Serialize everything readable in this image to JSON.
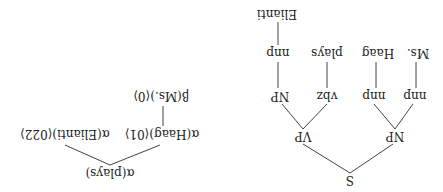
{
  "parse_tree": {
    "root": "S",
    "np_subject": "NP",
    "vp": "VP",
    "nnp1": "nnp",
    "nnp2": "nnp",
    "vbz": "vbz",
    "np_object": "NP",
    "word_ms": "Ms.",
    "word_haag": "Haag",
    "word_plays": "plays",
    "nnp3": "nnp",
    "word_elianti": "Elianti"
  },
  "derivation_tree": {
    "root": "α(plays)",
    "haag": "α(Haag)⟨01⟩",
    "elianti": "α(Elianti)⟨022⟩",
    "ms": "β(Ms.)⟨0⟩"
  }
}
